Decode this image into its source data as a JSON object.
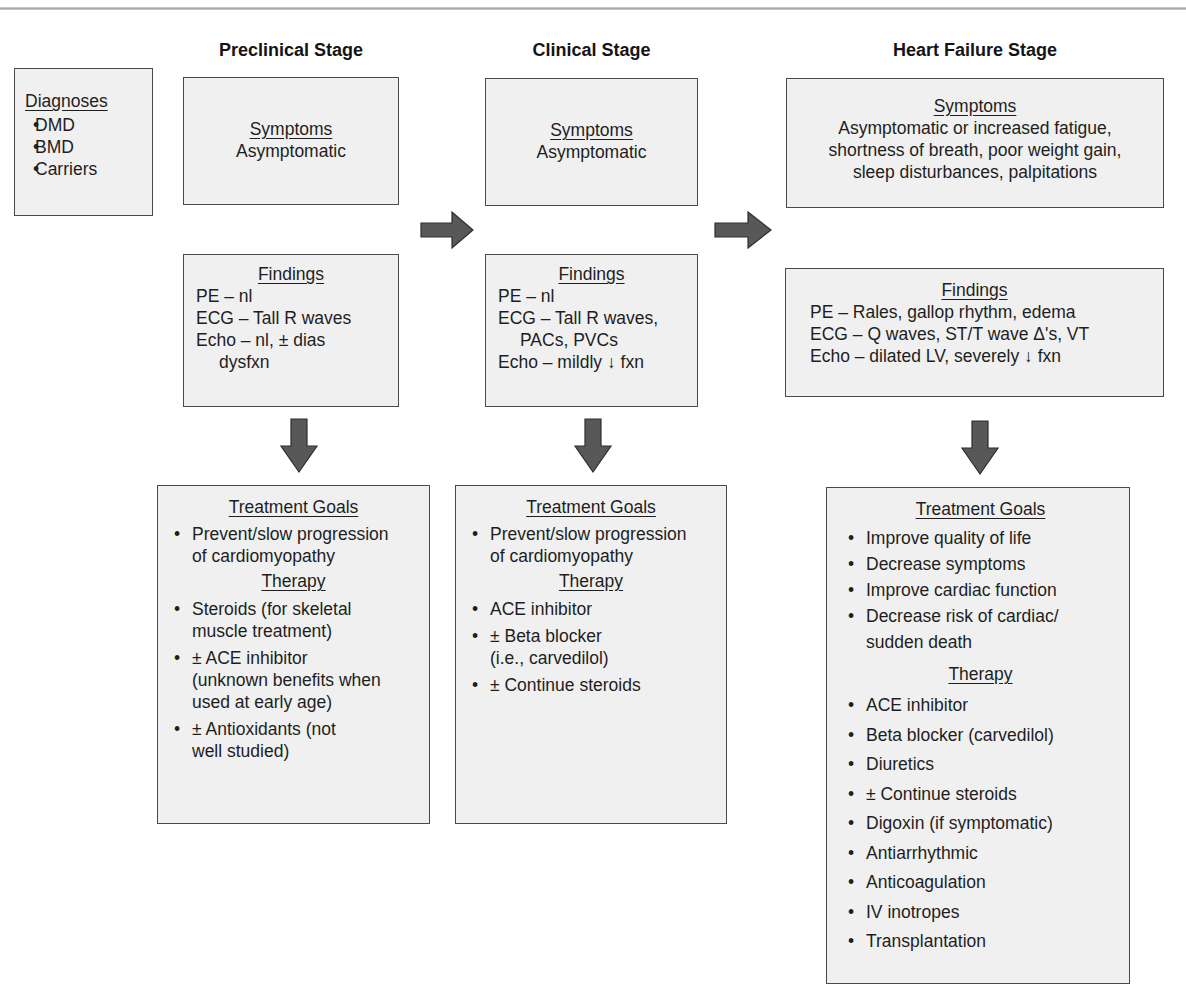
{
  "stages": [
    {
      "title": "Preclinical Stage"
    },
    {
      "title": "Clinical Stage"
    },
    {
      "title": "Heart Failure Stage"
    }
  ],
  "diagnoses": {
    "heading": "Diagnoses",
    "items": [
      "DMD",
      "BMD",
      "Carriers"
    ]
  },
  "preclinical": {
    "symptoms": {
      "heading": "Symptoms",
      "lines": [
        "Asymptomatic"
      ]
    },
    "findings": {
      "heading": "Findings",
      "lines": [
        "PE – nl",
        "ECG – Tall R waves",
        "Echo – nl, ± dias",
        "dysfxn"
      ]
    },
    "treatment": {
      "goals_heading": "Treatment Goals",
      "goals": [
        "Prevent/slow progression",
        "of cardiomyopathy"
      ],
      "therapy_heading": "Therapy",
      "therapy": [
        {
          "l1": "Steroids (for skeletal",
          "l2": "muscle treatment)"
        },
        {
          "l1": "± ACE inhibitor",
          "l2": "(unknown benefits when",
          "l3": "used at early age)"
        },
        {
          "l1": "± Antioxidants (not",
          "l2": "well studied)"
        }
      ]
    }
  },
  "clinical": {
    "symptoms": {
      "heading": "Symptoms",
      "lines": [
        "Asymptomatic"
      ]
    },
    "findings": {
      "heading": "Findings",
      "lines": [
        "PE – nl",
        "ECG – Tall R waves,",
        "PACs, PVCs",
        "Echo – mildly ↓ fxn"
      ]
    },
    "treatment": {
      "goals_heading": "Treatment Goals",
      "goals": [
        "Prevent/slow progression",
        "of cardiomyopathy"
      ],
      "therapy_heading": "Therapy",
      "therapy": [
        {
          "l1": "ACE inhibitor"
        },
        {
          "l1": "± Beta blocker",
          "l2": "(i.e., carvedilol)"
        },
        {
          "l1": "± Continue steroids"
        }
      ]
    }
  },
  "heart_failure": {
    "symptoms": {
      "heading": "Symptoms",
      "lines": [
        "Asymptomatic or increased fatigue,",
        "shortness of breath, poor weight gain,",
        "sleep disturbances, palpitations"
      ]
    },
    "findings": {
      "heading": "Findings",
      "lines": [
        "PE – Rales, gallop rhythm, edema",
        "ECG – Q waves, ST/T wave Δ's, VT",
        "Echo – dilated LV, severely ↓ fxn"
      ]
    },
    "treatment": {
      "goals_heading": "Treatment Goals",
      "goals": [
        {
          "l1": "Improve quality of life"
        },
        {
          "l1": "Decrease symptoms"
        },
        {
          "l1": "Improve cardiac function"
        },
        {
          "l1": "Decrease risk of cardiac/",
          "l2": "sudden death"
        }
      ],
      "therapy_heading": "Therapy",
      "therapy": [
        "ACE inhibitor",
        "Beta blocker (carvedilol)",
        "Diuretics",
        "± Continue steroids",
        "Digoxin (if symptomatic)",
        "Antiarrhythmic",
        "Anticoagulation",
        "IV inotropes",
        "Transplantation"
      ]
    }
  },
  "colors": {
    "box_fill": "#f0f0f0",
    "box_border": "#4a4a4a",
    "arrow_fill": "#585858",
    "arrow_stroke": "#2e2e2e"
  }
}
